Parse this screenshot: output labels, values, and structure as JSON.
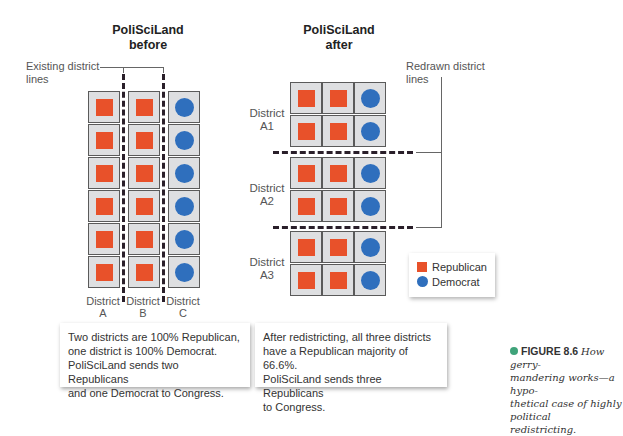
{
  "colors": {
    "republican": "#e8512a",
    "democrat": "#2f6fbd",
    "cell_bg": "#dedfe1",
    "caption_dot": "#3fa37a"
  },
  "before": {
    "title_line1": "PoliSciLand",
    "title_line2": "before",
    "bracket_label_line1": "Existing district",
    "bracket_label_line2": "lines",
    "districts": [
      {
        "label_line1": "District",
        "label_line2": "A",
        "voters": [
          "R",
          "R",
          "R",
          "R",
          "R",
          "R"
        ]
      },
      {
        "label_line1": "District",
        "label_line2": "B",
        "voters": [
          "R",
          "R",
          "R",
          "R",
          "R",
          "R"
        ]
      },
      {
        "label_line1": "District",
        "label_line2": "C",
        "voters": [
          "D",
          "D",
          "D",
          "D",
          "D",
          "D"
        ]
      }
    ],
    "note": "Two districts are 100% Republican, one district is 100% Democrat. PoliSciLand sends two Republicans and one Democrat to Congress.",
    "note_lines": [
      "Two districts are 100% Republican,",
      "one district is 100% Democrat.",
      "PoliSciLand sends two Republicans",
      "and one Democrat to Congress."
    ]
  },
  "after": {
    "title_line1": "PoliSciLand",
    "title_line2": "after",
    "bracket_label_line1": "Redrawn district",
    "bracket_label_line2": "lines",
    "districts": [
      {
        "label_line1": "District",
        "label_line2": "A1",
        "rows": [
          [
            "R",
            "R",
            "D"
          ],
          [
            "R",
            "R",
            "D"
          ]
        ]
      },
      {
        "label_line1": "District",
        "label_line2": "A2",
        "rows": [
          [
            "R",
            "R",
            "D"
          ],
          [
            "R",
            "R",
            "D"
          ]
        ]
      },
      {
        "label_line1": "District",
        "label_line2": "A3",
        "rows": [
          [
            "R",
            "R",
            "D"
          ],
          [
            "R",
            "R",
            "D"
          ]
        ]
      }
    ],
    "note_lines": [
      "After redistricting, all three districts",
      "have a Republican majority of 66.6%.",
      "PoliSciLand sends three Republicans",
      "to Congress."
    ]
  },
  "legend": {
    "items": [
      {
        "label": "Republican",
        "shape": "square"
      },
      {
        "label": "Democrat",
        "shape": "circle"
      }
    ]
  },
  "caption": {
    "figure_label": "FIGURE 8.6",
    "lines": [
      "How gerry-",
      "mandering works—a hypo-",
      "thetical case of highly political",
      "redistricting."
    ]
  }
}
